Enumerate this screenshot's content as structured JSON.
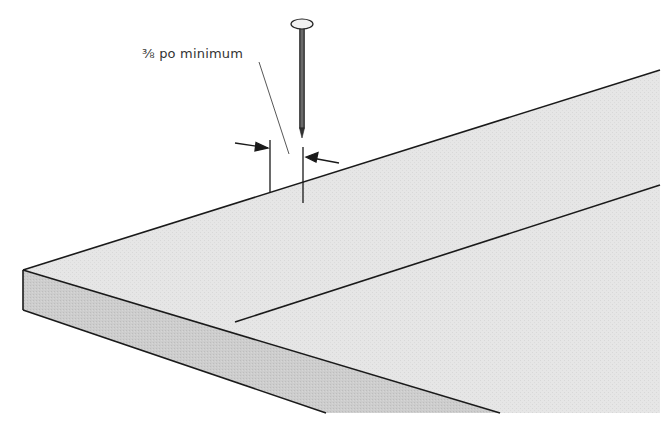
{
  "figure": {
    "type": "technical-illustration",
    "annotation": {
      "label": "⅜ po minimum"
    },
    "colors": {
      "background": "#ffffff",
      "board_top": "#e4e4e4",
      "board_side": "#cfcfcf",
      "outline": "#1a1a1a",
      "nail": "#555555",
      "nail_head": "#f2f2f2"
    }
  }
}
